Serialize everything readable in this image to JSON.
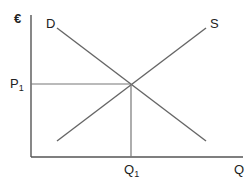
{
  "diagram": {
    "colors": {
      "axis": "#555555",
      "curve": "#666666",
      "guide": "#777777",
      "text": "#222222"
    },
    "axes": {
      "y_label": "€",
      "x_label": "Q"
    },
    "curves": {
      "demand_label": "D",
      "supply_label": "S"
    },
    "equilibrium": {
      "price_label_main": "P",
      "price_label_sub": "1",
      "quantity_label_main": "Q",
      "quantity_label_sub": "1"
    }
  }
}
